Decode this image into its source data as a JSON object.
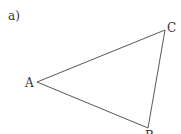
{
  "part_label": "a)",
  "triangle": {
    "vertices": {
      "A": {
        "label": "A",
        "x": 37,
        "y": 82
      },
      "B": {
        "label": "B",
        "x": 148,
        "y": 128
      },
      "C": {
        "label": "C",
        "x": 165,
        "y": 30
      }
    },
    "stroke": "#444444"
  }
}
